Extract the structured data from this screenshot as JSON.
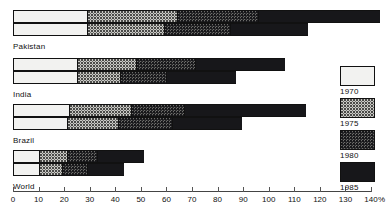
{
  "chart_data": {
    "type": "bar",
    "orientation": "horizontal",
    "title": "",
    "subtitle": "",
    "xlabel": "%",
    "ylabel": "",
    "xlim": [
      0,
      140
    ],
    "grid": false,
    "legend_position": "right",
    "stacked": true,
    "axis": {
      "unit": "%",
      "ticks": [
        0,
        10,
        20,
        30,
        40,
        50,
        60,
        70,
        80,
        90,
        100,
        110,
        120,
        130,
        140
      ],
      "tick_labels": [
        "0",
        "10",
        "20",
        "30",
        "40",
        "50",
        "60",
        "70",
        "80",
        "90",
        "100",
        "110",
        "120",
        "130",
        "140"
      ]
    },
    "legend": [
      {
        "label": "1970",
        "swatch": "p1970",
        "color": "#f2f2f0"
      },
      {
        "label": "1975",
        "swatch": "p1975",
        "color": "#c9c9c5"
      },
      {
        "label": "1980",
        "swatch": "p1980",
        "color": "#6d6d6a"
      },
      {
        "label": "1985",
        "swatch": "p1985",
        "color": "#17171a"
      }
    ],
    "categories": [
      "Pakistan",
      "India",
      "Brazil",
      "World"
    ],
    "series": [
      {
        "name": "1970",
        "values_upper": [
          29,
          25,
          22,
          10
        ],
        "values_lower": [
          29,
          25,
          21,
          10
        ]
      },
      {
        "name": "1975",
        "values_upper": [
          35,
          23,
          24,
          11
        ],
        "values_lower": [
          30,
          17,
          20,
          9
        ]
      },
      {
        "name": "1980",
        "values_upper": [
          32,
          23,
          21,
          12
        ],
        "values_lower": [
          26,
          18,
          21,
          10
        ]
      },
      {
        "name": "1985",
        "values_upper": [
          47,
          35,
          47,
          18
        ],
        "values_lower": [
          30,
          27,
          27,
          14
        ]
      }
    ],
    "groups": [
      {
        "name": "Pakistan",
        "upper": {
          "cumulative": [
            29,
            64,
            96,
            143
          ],
          "segments": [
            {
              "year": "1970",
              "start": 0,
              "end": 29,
              "value": 29
            },
            {
              "year": "1975",
              "start": 29,
              "end": 64,
              "value": 35
            },
            {
              "year": "1980",
              "start": 64,
              "end": 96,
              "value": 32
            },
            {
              "year": "1985",
              "start": 96,
              "end": 143,
              "value": 47
            }
          ]
        },
        "lower": {
          "cumulative": [
            29,
            59,
            85,
            115
          ],
          "segments": [
            {
              "year": "1970",
              "start": 0,
              "end": 29,
              "value": 29
            },
            {
              "year": "1975",
              "start": 29,
              "end": 59,
              "value": 30
            },
            {
              "year": "1980",
              "start": 59,
              "end": 85,
              "value": 26
            },
            {
              "year": "1985",
              "start": 85,
              "end": 115,
              "value": 30
            }
          ]
        }
      },
      {
        "name": "India",
        "upper": {
          "cumulative": [
            25,
            48,
            71,
            106
          ],
          "segments": [
            {
              "year": "1970",
              "start": 0,
              "end": 25,
              "value": 25
            },
            {
              "year": "1975",
              "start": 25,
              "end": 48,
              "value": 23
            },
            {
              "year": "1980",
              "start": 48,
              "end": 71,
              "value": 23
            },
            {
              "year": "1985",
              "start": 71,
              "end": 106,
              "value": 35
            }
          ]
        },
        "lower": {
          "cumulative": [
            25,
            42,
            60,
            87
          ],
          "segments": [
            {
              "year": "1970",
              "start": 0,
              "end": 25,
              "value": 25
            },
            {
              "year": "1975",
              "start": 25,
              "end": 42,
              "value": 17
            },
            {
              "year": "1980",
              "start": 42,
              "end": 60,
              "value": 18
            },
            {
              "year": "1985",
              "start": 60,
              "end": 87,
              "value": 27
            }
          ]
        }
      },
      {
        "name": "Brazil",
        "upper": {
          "cumulative": [
            22,
            46,
            67,
            114
          ],
          "segments": [
            {
              "year": "1970",
              "start": 0,
              "end": 22,
              "value": 22
            },
            {
              "year": "1975",
              "start": 22,
              "end": 46,
              "value": 24
            },
            {
              "year": "1980",
              "start": 46,
              "end": 67,
              "value": 21
            },
            {
              "year": "1985",
              "start": 67,
              "end": 114,
              "value": 47
            }
          ]
        },
        "lower": {
          "cumulative": [
            21,
            41,
            62,
            89
          ],
          "segments": [
            {
              "year": "1970",
              "start": 0,
              "end": 21,
              "value": 21
            },
            {
              "year": "1975",
              "start": 21,
              "end": 41,
              "value": 20
            },
            {
              "year": "1980",
              "start": 41,
              "end": 62,
              "value": 21
            },
            {
              "year": "1985",
              "start": 62,
              "end": 89,
              "value": 27
            }
          ]
        }
      },
      {
        "name": "World",
        "upper": {
          "cumulative": [
            10,
            21,
            33,
            51
          ],
          "segments": [
            {
              "year": "1970",
              "start": 0,
              "end": 10,
              "value": 10
            },
            {
              "year": "1975",
              "start": 10,
              "end": 21,
              "value": 11
            },
            {
              "year": "1980",
              "start": 21,
              "end": 33,
              "value": 12
            },
            {
              "year": "1985",
              "start": 33,
              "end": 51,
              "value": 18
            }
          ]
        },
        "lower": {
          "cumulative": [
            10,
            19,
            29,
            43
          ],
          "segments": [
            {
              "year": "1970",
              "start": 0,
              "end": 10,
              "value": 10
            },
            {
              "year": "1975",
              "start": 10,
              "end": 19,
              "value": 9
            },
            {
              "year": "1980",
              "start": 19,
              "end": 29,
              "value": 10
            },
            {
              "year": "1985",
              "start": 29,
              "end": 43,
              "value": 14
            }
          ]
        }
      }
    ]
  }
}
